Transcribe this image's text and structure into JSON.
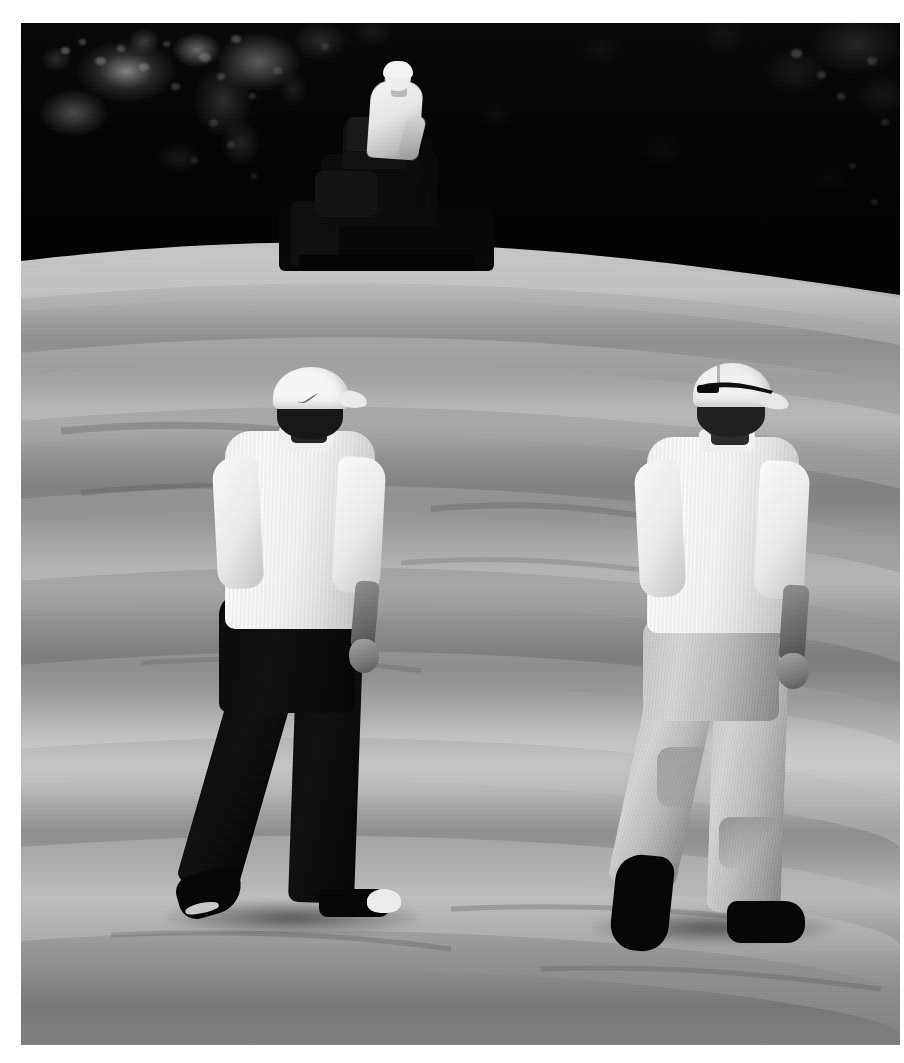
{
  "photo": {
    "title": "Two golfers walking a fairway with a greens mower in the background",
    "medium": "photograph",
    "tone": "black-and-white",
    "orientation": "portrait",
    "border_color": "#ffffff",
    "frame_width_px": 904,
    "frame_height_px": 1063
  },
  "scene": {
    "setting_label": "golf course fairway",
    "background_label": "dark treeline",
    "ground_label": "mown fairway with horizontal mowing stripes",
    "horizon_label": "curved ridge line"
  },
  "subjects": {
    "mower": {
      "name": "ride-on greens mower",
      "operator_label": "mower operator",
      "operator_shirt": "white shirt",
      "operator_cap": "light cap",
      "body_color": "#0b0b0b"
    },
    "golfer_left": {
      "name": "golfer in dark trousers",
      "cap_label": "white cap with Nike swoosh",
      "cap_color": "#f4f4f1",
      "shirt_label": "white striped polo shirt",
      "shirt_color": "#f7f7f4",
      "trousers_label": "black trousers",
      "trousers_color": "#0d0d0d",
      "shoes_label": "black and white golf shoes",
      "pose_label": "walking, mid-stride, viewed from behind"
    },
    "golfer_right": {
      "name": "golfer in khaki trousers",
      "cap_label": "white cap with sunglasses resting on the back",
      "cap_color": "#efefec",
      "sunglasses_color": "#111111",
      "shirt_label": "white polo shirt",
      "shirt_color": "#f6f6f3",
      "trousers_label": "light khaki trousers",
      "trousers_color": "#c4c4bd",
      "belt_label": "dark belt",
      "belt_color": "#2a2a27",
      "shoes_label": "dark golf shoes",
      "pose_label": "walking, mid-stride, viewed from behind"
    }
  },
  "palette": {
    "treeline_dark": "#070706",
    "fairway_light": "#c6c6c0",
    "fairway_mid": "#a4a49f",
    "fairway_dark": "#8a8a84",
    "highlight_white": "#fbfbf9",
    "shadow_black": "#080808"
  },
  "stripes": {
    "label": "mowing bands",
    "count": 9,
    "bands": [
      {
        "top_pct": 3,
        "height_pct": 4.5,
        "shade": "light"
      },
      {
        "top_pct": 12,
        "height_pct": 5.0,
        "shade": "dark"
      },
      {
        "top_pct": 22,
        "height_pct": 5.5,
        "shade": "light"
      },
      {
        "top_pct": 33,
        "height_pct": 6.0,
        "shade": "dark"
      },
      {
        "top_pct": 45,
        "height_pct": 6.5,
        "shade": "light"
      },
      {
        "top_pct": 57,
        "height_pct": 6.0,
        "shade": "light"
      },
      {
        "top_pct": 68,
        "height_pct": 6.5,
        "shade": "dark"
      },
      {
        "top_pct": 79,
        "height_pct": 7.0,
        "shade": "light"
      },
      {
        "top_pct": 90,
        "height_pct": 8.0,
        "shade": "dark"
      }
    ]
  }
}
